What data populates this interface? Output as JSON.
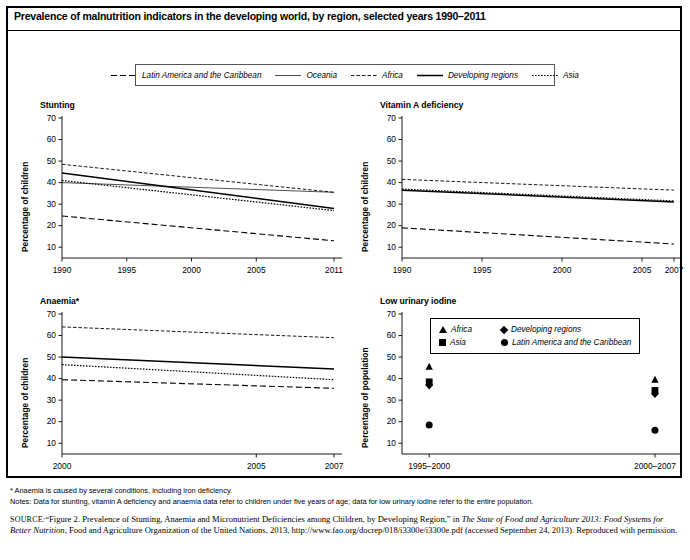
{
  "figure": {
    "title": "Prevalence of malnutrition indicators in the developing world, by region, selected years 1990–2011"
  },
  "legend": {
    "items": [
      {
        "label": "Latin America and the Caribbean",
        "style": "dashed"
      },
      {
        "label": "Oceania",
        "style": "solid-thin"
      },
      {
        "label": "Africa",
        "style": "dashdot"
      },
      {
        "label": "Developing regions",
        "style": "solid"
      },
      {
        "label": "Asia",
        "style": "dotted"
      }
    ]
  },
  "footnotes": {
    "asterisk": "* Anaemia is caused by several conditions, including iron deficiency.",
    "notes": "Notes: Data for stunting, vitamin A deficiency and anaemia data refer to children under five years of age; data for low urinary iodine refer to the entire population."
  },
  "source": {
    "label": "SOURCE:",
    "text_1": "“Figure 2. Prevalence of Stunting, Anaemia and Micronutrient Deficiencies among Children, by Developing Region,” in ",
    "italic_1": "The State of Food and Agriculture 2013: Food Systems for Better Nutrition",
    "text_2": ", Food and Agriculture Organization of the United Nations, 2013, http://www.fao.org/docrep/018/i3300e/i3300e.pdf (accessed September 24, 2013). Reproduced with permission."
  },
  "chart_data": [
    {
      "type": "line",
      "title": "Stunting",
      "xlabel": "",
      "ylabel": "Percentage of children",
      "ylim": [
        5,
        70
      ],
      "yticks": [
        10,
        20,
        30,
        40,
        50,
        60,
        70
      ],
      "xlim": [
        1990,
        2011
      ],
      "xticks": [
        1990,
        1995,
        2000,
        2005,
        2011
      ],
      "xtick_labels": [
        "1990",
        "1995",
        "2000",
        "2005",
        "2011"
      ],
      "grid": false,
      "series": [
        {
          "name": "Africa",
          "style": "dashdot",
          "x": [
            1990,
            2011
          ],
          "values": [
            48.5,
            35.5
          ]
        },
        {
          "name": "Developing regions",
          "style": "solid",
          "x": [
            1990,
            2011
          ],
          "values": [
            44.5,
            28.0
          ]
        },
        {
          "name": "Asia",
          "style": "dotted",
          "x": [
            1990,
            2011
          ],
          "values": [
            41.0,
            27.0
          ]
        },
        {
          "name": "Oceania",
          "style": "solid-thin",
          "x": [
            1990,
            2011
          ],
          "values": [
            40.0,
            35.5
          ]
        },
        {
          "name": "Latin America and the Caribbean",
          "style": "dashed",
          "x": [
            1990,
            2011
          ],
          "values": [
            24.5,
            13.0
          ]
        }
      ]
    },
    {
      "type": "line",
      "title": "Vitamin A deficiency",
      "xlabel": "",
      "ylabel": "Percentage of children",
      "ylim": [
        5,
        70
      ],
      "yticks": [
        10,
        20,
        30,
        40,
        50,
        60,
        70
      ],
      "xlim": [
        1990,
        2007
      ],
      "xticks": [
        1990,
        1995,
        2000,
        2005,
        2007
      ],
      "xtick_labels": [
        "1990",
        "1995",
        "2000",
        "2005",
        "2007"
      ],
      "grid": false,
      "series": [
        {
          "name": "Africa",
          "style": "dashdot",
          "x": [
            1990,
            2007
          ],
          "values": [
            41.5,
            36.5
          ]
        },
        {
          "name": "Asia",
          "style": "dotted",
          "x": [
            1990,
            2007
          ],
          "values": [
            37.0,
            31.5
          ]
        },
        {
          "name": "Developing regions",
          "style": "solid",
          "x": [
            1990,
            2007
          ],
          "values": [
            36.5,
            31.0
          ]
        },
        {
          "name": "Latin America and the Caribbean",
          "style": "dashed",
          "x": [
            1990,
            2007
          ],
          "values": [
            19.0,
            11.5
          ]
        }
      ]
    },
    {
      "type": "line",
      "title": "Anaemia*",
      "xlabel": "",
      "ylabel": "Percentage of children",
      "ylim": [
        5,
        70
      ],
      "yticks": [
        10,
        20,
        30,
        40,
        50,
        60,
        70
      ],
      "xlim": [
        2000,
        2007
      ],
      "xticks": [
        2000,
        2005,
        2007
      ],
      "xtick_labels": [
        "2000",
        "2005",
        "2007"
      ],
      "grid": false,
      "series": [
        {
          "name": "Africa",
          "style": "dashdot",
          "x": [
            2000,
            2007
          ],
          "values": [
            64.0,
            59.0
          ]
        },
        {
          "name": "Developing regions",
          "style": "solid",
          "x": [
            2000,
            2007
          ],
          "values": [
            50.0,
            44.5
          ]
        },
        {
          "name": "Asia",
          "style": "dotted",
          "x": [
            2000,
            2007
          ],
          "values": [
            46.5,
            39.5
          ]
        },
        {
          "name": "Latin America and the Caribbean",
          "style": "dashed",
          "x": [
            2000,
            2007
          ],
          "values": [
            39.5,
            35.5
          ]
        }
      ]
    },
    {
      "type": "scatter",
      "title": "Low urinary iodine",
      "xlabel": "",
      "ylabel": "Percentage of population",
      "ylim": [
        5,
        70
      ],
      "yticks": [
        10,
        20,
        30,
        40,
        50,
        60,
        70
      ],
      "xtick_labels": [
        "1995–2000",
        "2000–2007"
      ],
      "grid": false,
      "legend_position": "top-center",
      "legend_entries": [
        {
          "label": "Africa",
          "marker": "triangle"
        },
        {
          "label": "Developing regions",
          "marker": "diamond"
        },
        {
          "label": "Asia",
          "marker": "square"
        },
        {
          "label": "Latin America and the Caribbean",
          "marker": "circle"
        }
      ],
      "points": [
        {
          "group": "1995–2000",
          "name": "Africa",
          "marker": "triangle",
          "value": 45.5
        },
        {
          "group": "1995–2000",
          "name": "Asia",
          "marker": "square",
          "value": 38.5
        },
        {
          "group": "1995–2000",
          "name": "Developing regions",
          "marker": "diamond",
          "value": 37.0
        },
        {
          "group": "1995–2000",
          "name": "Latin America and the Caribbean",
          "marker": "circle",
          "value": 18.5
        },
        {
          "group": "2000–2007",
          "name": "Africa",
          "marker": "triangle",
          "value": 39.5
        },
        {
          "group": "2000–2007",
          "name": "Asia",
          "marker": "square",
          "value": 34.5
        },
        {
          "group": "2000–2007",
          "name": "Developing regions",
          "marker": "diamond",
          "value": 33.0
        },
        {
          "group": "2000–2007",
          "name": "Latin America and the Caribbean",
          "marker": "circle",
          "value": 16.0
        }
      ]
    }
  ]
}
